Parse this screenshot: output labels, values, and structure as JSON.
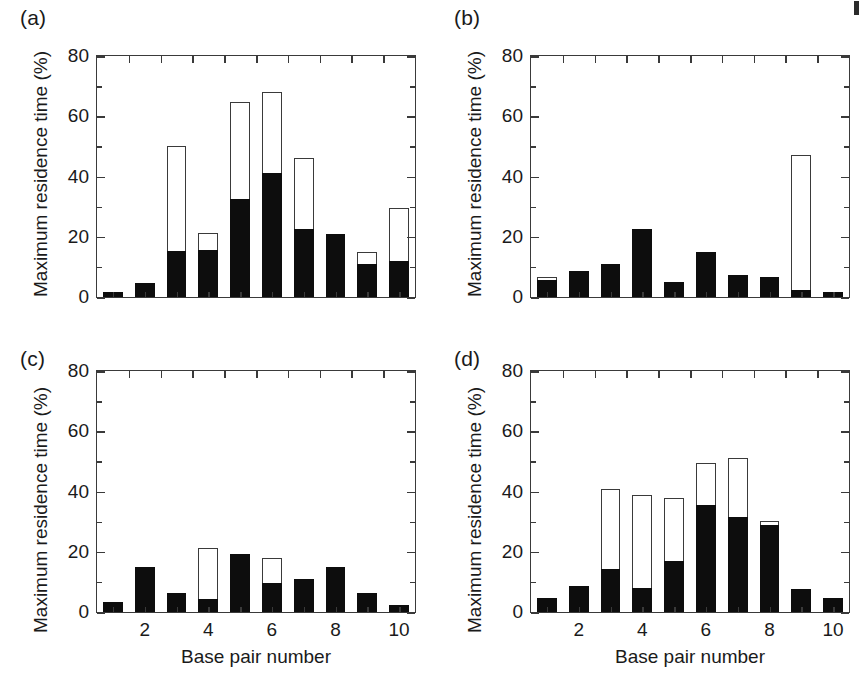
{
  "figure": {
    "background": "#ffffff",
    "ink_color": "#1a1a1a",
    "solid_color": "#0d0d0d",
    "open_color": "#ffffff",
    "axis_color": "#3a3a3a",
    "corner_mark": ""
  },
  "axes": {
    "ylabel": "Maximum residence time (%)",
    "xlabel": "Base pair number",
    "ylim": [
      0,
      80
    ],
    "yticks_major": [
      0,
      20,
      40,
      60,
      80
    ],
    "yticks_major_labels": [
      "0",
      "20",
      "40",
      "60",
      "80"
    ],
    "yticks_minor": [
      10,
      30,
      50,
      70
    ],
    "xlim": [
      0.5,
      10.5
    ],
    "xticks": [
      2,
      4,
      6,
      8,
      10
    ],
    "xticks_labels": [
      "2",
      "4",
      "6",
      "8",
      "10"
    ],
    "grid": false,
    "legend": "none"
  },
  "panels": [
    {
      "key": "a",
      "label": "(a)",
      "show_xaxis_labels": false
    },
    {
      "key": "b",
      "label": "(b)",
      "show_xaxis_labels": false
    },
    {
      "key": "c",
      "label": "(c)",
      "show_xaxis_labels": true
    },
    {
      "key": "d",
      "label": "(d)",
      "show_xaxis_labels": true
    }
  ],
  "chart_data": [
    {
      "type": "bar",
      "panel": "a",
      "title": "(a)",
      "xlabel": "Base pair number",
      "ylabel": "Maximum residence time (%)",
      "ylim": [
        0,
        80
      ],
      "grid": false,
      "categories": [
        1,
        2,
        3,
        4,
        5,
        6,
        7,
        8,
        9,
        10
      ],
      "series": [
        {
          "name": "solid (filled)",
          "values": [
            1.5,
            4.5,
            15.3,
            15.5,
            32.5,
            41.3,
            22.5,
            21.0,
            10.8,
            11.8
          ]
        },
        {
          "name": "open (total)",
          "values": [
            1.5,
            4.5,
            50.2,
            21.3,
            64.8,
            68.0,
            46.3,
            21.0,
            15.0,
            29.7
          ]
        }
      ]
    },
    {
      "type": "bar",
      "panel": "b",
      "title": "(b)",
      "xlabel": "Base pair number",
      "ylabel": "Maximum residence time (%)",
      "ylim": [
        0,
        80
      ],
      "grid": false,
      "categories": [
        1,
        2,
        3,
        4,
        5,
        6,
        7,
        8,
        9,
        10
      ],
      "series": [
        {
          "name": "solid (filled)",
          "values": [
            5.8,
            8.5,
            11.0,
            22.5,
            5.0,
            14.8,
            7.3,
            6.5,
            2.2,
            1.8
          ]
        },
        {
          "name": "open (total)",
          "values": [
            6.8,
            8.5,
            11.0,
            22.5,
            5.0,
            14.8,
            7.3,
            6.5,
            47.0,
            1.8
          ]
        }
      ]
    },
    {
      "type": "bar",
      "panel": "c",
      "title": "(c)",
      "xlabel": "Base pair number",
      "ylabel": "Maximum residence time (%)",
      "ylim": [
        0,
        80
      ],
      "grid": false,
      "categories": [
        1,
        2,
        3,
        4,
        5,
        6,
        7,
        8,
        9,
        10
      ],
      "series": [
        {
          "name": "solid (filled)",
          "values": [
            3.2,
            14.8,
            6.2,
            4.3,
            19.3,
            9.5,
            11.0,
            14.8,
            6.3,
            2.2
          ]
        },
        {
          "name": "open (total)",
          "values": [
            3.2,
            14.8,
            6.2,
            21.2,
            19.3,
            18.0,
            11.0,
            14.8,
            6.3,
            2.2
          ]
        }
      ]
    },
    {
      "type": "bar",
      "panel": "d",
      "title": "(d)",
      "xlabel": "Base pair number",
      "ylabel": "Maximum residence time (%)",
      "ylim": [
        0,
        80
      ],
      "grid": false,
      "categories": [
        1,
        2,
        3,
        4,
        5,
        6,
        7,
        8,
        9,
        10
      ],
      "series": [
        {
          "name": "solid (filled)",
          "values": [
            4.8,
            8.5,
            14.2,
            8.0,
            17.0,
            35.5,
            31.5,
            29.0,
            7.5,
            4.5
          ]
        },
        {
          "name": "open (total)",
          "values": [
            4.8,
            8.5,
            41.0,
            38.7,
            37.8,
            49.5,
            51.0,
            30.3,
            7.5,
            4.5
          ]
        }
      ]
    }
  ]
}
